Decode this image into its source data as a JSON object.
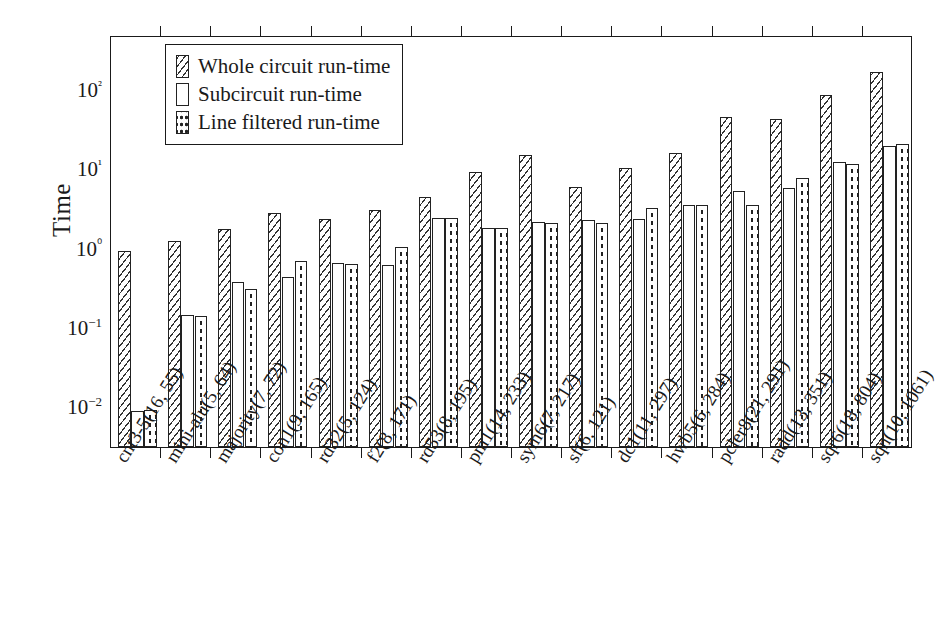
{
  "chart_data": {
    "type": "bar",
    "title": "",
    "xlabel": "",
    "ylabel": "Time",
    "yscale": "log",
    "ylim": [
      0.004,
      400
    ],
    "ytick_labels": [
      "10−2",
      "10−1",
      "10⁰",
      "10¹",
      "10²"
    ],
    "ytick_values": [
      0.01,
      0.1,
      1,
      10,
      100
    ],
    "grid": false,
    "legend_position": "upper left inside",
    "categories": [
      "cnt3-5(16, 55)",
      "mini-alu(5, 64)",
      "majority(7, 72)",
      "con1(9, 165)",
      "rd32(5, 124)",
      "f2(8, 171)",
      "rd53(8, 195)",
      "pm1(14, 233)",
      "sym6(7, 217)",
      "sf(6, 121)",
      "dc1(11, 297)",
      "hwb5(6, 284)",
      "pcler8(21, 291)",
      "radd(13, 351)",
      "sqr6(18, 804)",
      "sqn(10, 1061)"
    ],
    "series": [
      {
        "name": "Whole circuit run-time",
        "pattern": "diagonal-hatch",
        "values": [
          1.0,
          1.3,
          1.85,
          3.0,
          2.5,
          3.2,
          4.8,
          9.8,
          16.0,
          6.3,
          11.0,
          17.0,
          48.0,
          45.0,
          92.0,
          180.0
        ]
      },
      {
        "name": "Subcircuit run-time",
        "pattern": "empty",
        "values": [
          0.0095,
          0.155,
          0.4,
          0.47,
          0.7,
          0.65,
          2.6,
          1.95,
          2.3,
          2.4,
          2.5,
          3.8,
          5.6,
          6.2,
          13.0,
          21.0
        ]
      },
      {
        "name": "Line filtered run-time",
        "pattern": "dotted",
        "values": [
          0.0098,
          0.148,
          0.33,
          0.74,
          0.68,
          1.1,
          2.6,
          1.9,
          2.25,
          2.25,
          3.4,
          3.8,
          3.7,
          8.2,
          12.5,
          22.0
        ]
      }
    ]
  },
  "axis": {
    "y_title": "Time"
  },
  "legend": {
    "entries": [
      {
        "label": "Whole circuit run-time",
        "pattern": "diagonal-hatch"
      },
      {
        "label": "Subcircuit run-time",
        "pattern": "empty"
      },
      {
        "label": "Line filtered run-time",
        "pattern": "dotted"
      }
    ]
  }
}
